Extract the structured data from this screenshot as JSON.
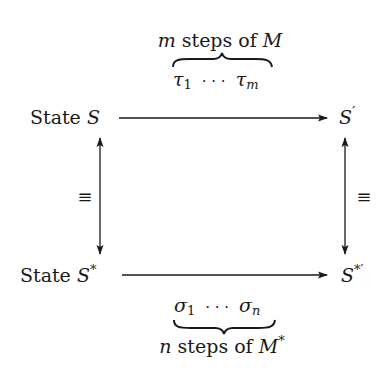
{
  "diagram": {
    "nodes": {
      "top_left": {
        "prefix": "State ",
        "symbol": "S",
        "sup": ""
      },
      "top_right": {
        "symbol": "S",
        "sup": "′"
      },
      "bottom_left": {
        "prefix": "State ",
        "symbol": "S",
        "sup": "*"
      },
      "bottom_right": {
        "symbol": "S",
        "sup": "*′"
      }
    },
    "edges": {
      "top": {
        "label_var": "m",
        "label_text": " steps of ",
        "label_machine": "M",
        "label_machine_sup": "",
        "seq_first": "τ",
        "seq_first_sub": "1",
        "seq_dots": "· · ·",
        "seq_last": "τ",
        "seq_last_sub": "m",
        "brace": "overbrace"
      },
      "bottom": {
        "label_var": "n",
        "label_text": " steps of ",
        "label_machine": "M",
        "label_machine_sup": "*",
        "seq_first": "σ",
        "seq_first_sub": "1",
        "seq_dots": "· · ·",
        "seq_last": "σ",
        "seq_last_sub": "n",
        "brace": "underbrace"
      },
      "left": {
        "label": "≡",
        "direction": "bidirectional"
      },
      "right": {
        "label": "≡",
        "direction": "bidirectional"
      }
    },
    "colors": {
      "ink": "#1a1a1a",
      "background": "#ffffff"
    }
  }
}
